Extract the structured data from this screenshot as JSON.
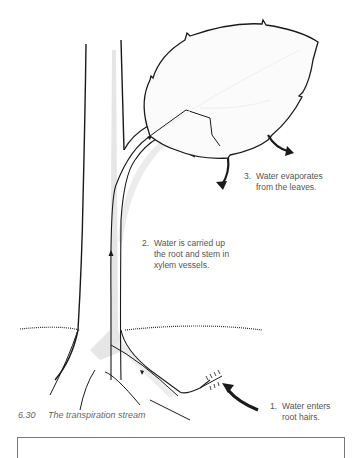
{
  "figure": {
    "number": "6.30",
    "title": "The transpiration stream"
  },
  "labels": [
    {
      "num": "1.",
      "line1": "Water enters",
      "line2": "root hairs."
    },
    {
      "num": "2.",
      "line1": "Water is carried up",
      "line2": "the root and stem in",
      "line3": "xylem vessels."
    },
    {
      "num": "3.",
      "line1": "Water evaporates",
      "line2": "from the leaves."
    }
  ],
  "colors": {
    "line": "#1a1a1a",
    "xylem_shade": "#e2e2e2",
    "text": "#555555"
  }
}
